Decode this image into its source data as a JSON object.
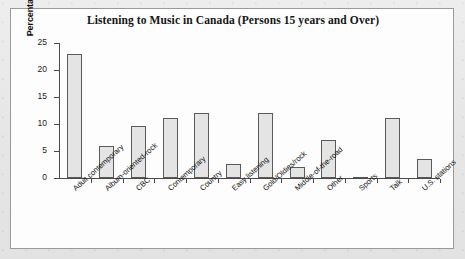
{
  "figure": {
    "title": "Listening to Music in Canada (Persons 15 years and Over)",
    "frame_color": "#9a9a9a",
    "background_color": "#e9e9e9",
    "plot_background": "#fdfdfd"
  },
  "chart_data": {
    "type": "bar",
    "title": "Listening to Music in Canada (Persons 15 years and Over)",
    "xlabel": "",
    "ylabel": "Percentage of population",
    "ylim": [
      0,
      25
    ],
    "yticks": [
      0,
      5,
      10,
      15,
      20,
      25
    ],
    "ytick_labels": [
      "0",
      "5",
      "10",
      "15",
      "20",
      "25"
    ],
    "grid": false,
    "legend": "none",
    "bar_fill_color": "#e4e4e4",
    "bar_edge_color": "#5a5a5a",
    "categories": [
      "Adult contemporary",
      "Album-oriented-rock",
      "CBC",
      "Contemporary",
      "Country",
      "Easy listening",
      "Gold/Oldies/rock",
      "Middle-of-the-road",
      "Other",
      "Sports",
      "Talk",
      "U.S. stations"
    ],
    "values": [
      23.0,
      5.9,
      9.6,
      11.2,
      12.0,
      2.6,
      12.0,
      2.1,
      7.1,
      0.2,
      11.2,
      3.5
    ]
  }
}
